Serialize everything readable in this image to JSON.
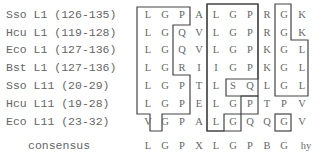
{
  "rows": [
    {
      "label": "Sso L1 (126-135)",
      "residues": [
        "L",
        "G",
        "P",
        "A",
        "L",
        "G",
        "P",
        "R",
        "G",
        "K"
      ]
    },
    {
      "label": "Hcu L1 (119-128)",
      "residues": [
        "L",
        "G",
        "Q",
        "V",
        "L",
        "G",
        "P",
        "R",
        "G",
        "K"
      ]
    },
    {
      "label": "Eco L1 (127-136)",
      "residues": [
        "L",
        "G",
        "Q",
        "V",
        "L",
        "G",
        "P",
        "K",
        "G",
        "L"
      ]
    },
    {
      "label": "Bst L1 (127-136)",
      "residues": [
        "L",
        "G",
        "R",
        "I",
        "I",
        "G",
        "P",
        "K",
        "G",
        "L"
      ]
    },
    {
      "label": "Sso L11 (20-29)",
      "residues": [
        "L",
        "G",
        "P",
        "T",
        "L",
        "S",
        "Q",
        "L",
        "G",
        "L"
      ]
    },
    {
      "label": "Hcu L11 (19-28)",
      "residues": [
        "L",
        "G",
        "P",
        "E",
        "L",
        "G",
        "P",
        "T",
        "P",
        "V"
      ]
    },
    {
      "label": "Eco L11 (23-32)",
      "residues": [
        "V",
        "G",
        "P",
        "A",
        "L",
        "G",
        "Q",
        "Q",
        "G",
        "V"
      ]
    }
  ],
  "consensus": {
    "label": "consensus",
    "residues": [
      "L",
      "G",
      "P",
      "X",
      "L",
      "G",
      "P",
      "B",
      "G",
      "hy"
    ]
  }
}
